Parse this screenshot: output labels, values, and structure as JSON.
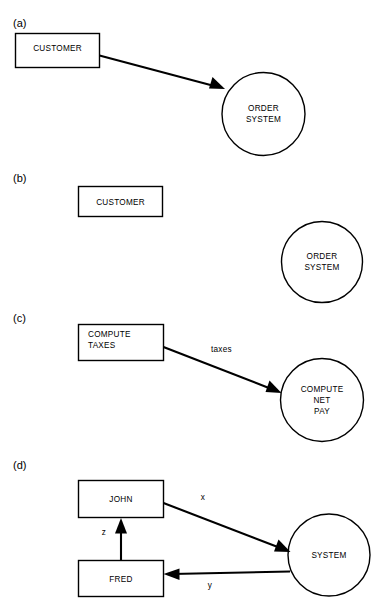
{
  "figure": {
    "background_color": "#ffffff",
    "line_color": "#000000",
    "text_color": "#000000",
    "panels": [
      {
        "label": "(a)",
        "nodes": [
          {
            "id": "a-customer",
            "type": "rectangle",
            "label": "CUSTOMER"
          },
          {
            "id": "a-order-system",
            "type": "circle",
            "label_line1": "ORDER",
            "label_line2": "SYSTEM"
          }
        ],
        "edges": [
          {
            "id": "a-edge-1",
            "from": "a-customer",
            "to": "a-order-system",
            "label": "",
            "arrow": "single"
          }
        ]
      },
      {
        "label": "(b)",
        "nodes": [
          {
            "id": "b-customer",
            "type": "rectangle",
            "label": "CUSTOMER"
          },
          {
            "id": "b-order-system",
            "type": "circle",
            "label_line1": "ORDER",
            "label_line2": "SYSTEM"
          }
        ],
        "edges": []
      },
      {
        "label": "(c)",
        "nodes": [
          {
            "id": "c-compute-taxes",
            "type": "rectangle",
            "label_line1": "COMPUTE",
            "label_line2": "TAXES"
          },
          {
            "id": "c-compute-net-pay",
            "type": "circle",
            "label_line1": "COMPUTE",
            "label_line2": "NET",
            "label_line3": "PAY"
          }
        ],
        "edges": [
          {
            "id": "c-edge-taxes",
            "from": "c-compute-taxes",
            "to": "c-compute-net-pay",
            "label": "taxes",
            "arrow": "single"
          }
        ]
      },
      {
        "label": "(d)",
        "nodes": [
          {
            "id": "d-john",
            "type": "rectangle",
            "label": "JOHN"
          },
          {
            "id": "d-fred",
            "type": "rectangle",
            "label": "FRED"
          },
          {
            "id": "d-system",
            "type": "circle",
            "label": "SYSTEM"
          }
        ],
        "edges": [
          {
            "id": "d-edge-x",
            "from": "d-john",
            "to": "d-system",
            "label": "x",
            "arrow": "single"
          },
          {
            "id": "d-edge-y",
            "from": "d-system",
            "to": "d-fred",
            "label": "y",
            "arrow": "single"
          },
          {
            "id": "d-edge-z",
            "from": "d-fred",
            "to": "d-john",
            "label": "z",
            "arrow": "single"
          }
        ]
      }
    ]
  }
}
